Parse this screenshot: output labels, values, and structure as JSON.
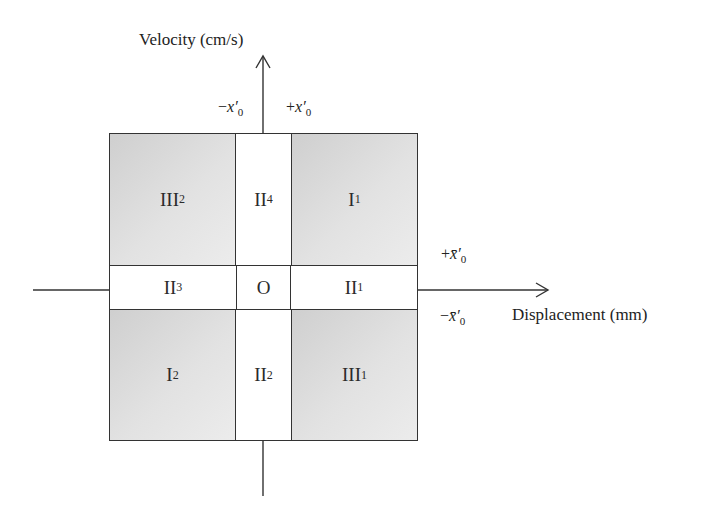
{
  "axes": {
    "y_label": "Velocity (cm/s)",
    "x_label": "Displacement (mm)"
  },
  "boundaries": {
    "neg_x": {
      "sign": "−",
      "var": "x′",
      "sub": "0"
    },
    "pos_x": {
      "sign": "+",
      "var": "x′",
      "sub": "0"
    },
    "pos_xbar": {
      "sign": "+",
      "var": "x̄′",
      "sub": "0"
    },
    "neg_xbar": {
      "sign": "−",
      "var": "x̄′",
      "sub": "0"
    }
  },
  "regions": {
    "top_left": {
      "base": "III",
      "sub": "2"
    },
    "top_mid": {
      "base": "II",
      "sub": "4"
    },
    "top_right": {
      "base": "I",
      "sub": "1"
    },
    "mid_left": {
      "base": "II",
      "sub": "3"
    },
    "center": {
      "base": "O",
      "sub": ""
    },
    "mid_right": {
      "base": "II",
      "sub": "1"
    },
    "bot_left": {
      "base": "I",
      "sub": "2"
    },
    "bot_mid": {
      "base": "II",
      "sub": "2"
    },
    "bot_right": {
      "base": "III",
      "sub": "1"
    }
  }
}
